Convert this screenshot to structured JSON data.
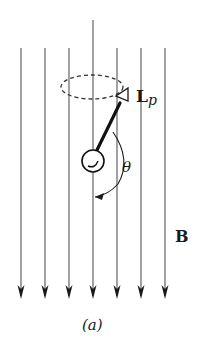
{
  "figure": {
    "caption": "(a)",
    "field_label": "B",
    "angular_momentum_label": "L",
    "angular_momentum_subscript": "p",
    "angle_label": "θ",
    "field_direction": "downward",
    "field_line_count": 7
  },
  "colors": {
    "background": "#ffffff",
    "ink": "#1a1a1a",
    "field_lines": "#555555"
  }
}
